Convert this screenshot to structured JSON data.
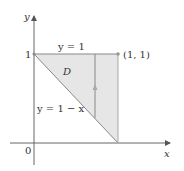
{
  "diagram": {
    "axes": {
      "x_label": "x",
      "y_label": "y",
      "origin_label": "0",
      "y_tick_label": "1"
    },
    "region": {
      "label": "D",
      "fill_color": "#e6e6e6",
      "vertices": [
        [
          0,
          1
        ],
        [
          1,
          1
        ],
        [
          1,
          0
        ]
      ]
    },
    "curves": {
      "top": "y = 1",
      "hypotenuse": "y = 1 − x"
    },
    "point_label": "(1, 1)",
    "arrow": "vertical line segment from y = 1 − x up to y = 1"
  }
}
